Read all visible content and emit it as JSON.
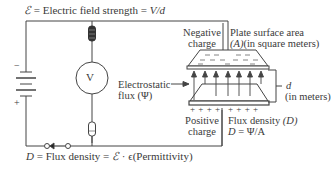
{
  "title_formula": {
    "symbol": "ℰ",
    "text": " = Electric field strength = ",
    "expr": "V/d"
  },
  "bottom_formula": {
    "symbol": "D",
    "text": " = Flux density = ",
    "symbol2": "ℰ",
    "text2": " · ϵ(Permittivity)"
  },
  "labels": {
    "negative_charge_1": "Negative",
    "negative_charge_2": "charge",
    "plate_area_1": "Plate surface area",
    "plate_area_2a": "(A)",
    "plate_area_2b": "(in square meters)",
    "flux_1": "Electrostatic",
    "flux_2": "flux (Ψ)",
    "distance_symbol": "d",
    "distance_unit": "(in meters)",
    "positive_charge_1": "Positive",
    "positive_charge_2": "charge",
    "flux_density_1a": "Flux density ",
    "flux_density_1b": "(D)",
    "flux_density_2a": "D",
    "flux_density_2b": " = Ψ/A",
    "voltmeter": "V",
    "battery_minus": "−",
    "battery_plus": "+",
    "plus_signs_left": "+ + + +",
    "plus_signs_right": "+ + + +"
  },
  "colors": {
    "line": "#444444",
    "text": "#3a3a3a",
    "background": "#ffffff"
  }
}
